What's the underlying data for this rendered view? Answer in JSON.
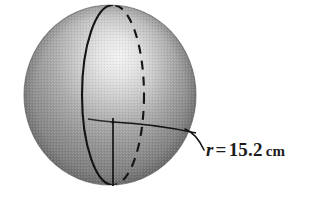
{
  "figure": {
    "type": "geometry-illustration",
    "background_color": "#ffffff",
    "canvas": {
      "width": 329,
      "height": 201
    }
  },
  "sphere": {
    "name": "shaded-sphere",
    "center": {
      "x": 110,
      "y": 95
    },
    "radius_x": 86,
    "radius_y": 90,
    "fill_dark": "#6e6e6e",
    "fill_mid": "#9a9a9a",
    "fill_light": "#e6e6e6",
    "highlight": {
      "x": 118,
      "y": 58
    },
    "outline_color": "#5a5a5a",
    "texture": "halftone-dither"
  },
  "great_circle": {
    "name": "vertical-great-circle",
    "center": {
      "x": 113,
      "y": 95
    },
    "radius_x": 31,
    "radius_y": 90,
    "front_style": "solid",
    "back_style": "dashed",
    "stroke_color": "#1a1a1a"
  },
  "radii": [
    {
      "name": "vertical-radius-line",
      "from": {
        "x": 113,
        "y": 122
      },
      "to": {
        "x": 113,
        "y": 186
      },
      "style": "solid",
      "stroke_color": "#1a1a1a"
    },
    {
      "name": "horizontal-radius-line",
      "from": {
        "x": 113,
        "y": 122
      },
      "to": {
        "x": 196,
        "y": 133
      },
      "style": "solid-curved",
      "stroke_color": "#1a1a1a"
    }
  ],
  "center_point": {
    "name": "sphere-center-point",
    "x": 113,
    "y": 122
  },
  "leader_line": {
    "name": "radius-leader-line",
    "from": {
      "x": 196,
      "y": 133
    },
    "to": {
      "x": 204,
      "y": 150
    },
    "stroke_color": "#1a1a1a"
  },
  "label": {
    "name": "radius-label",
    "symbol": "r",
    "equals": "=",
    "value": "15.2",
    "unit": "cm",
    "full_text": "r = 15.2 cm",
    "color": "#1c1c1c",
    "position": {
      "x": 206,
      "y": 140
    }
  }
}
